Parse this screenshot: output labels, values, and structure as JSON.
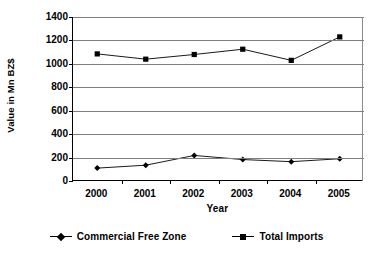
{
  "chart_data": {
    "type": "line",
    "title": "",
    "xlabel": "Year",
    "ylabel": "Value in Mn BZ$",
    "categories": [
      "2000",
      "2001",
      "2002",
      "2003",
      "2004",
      "2005"
    ],
    "ylim": [
      0,
      1400
    ],
    "yticks": [
      "1400",
      "1200",
      "1000",
      "800",
      "600",
      "400",
      "200",
      "0"
    ],
    "ytick_values": [
      1400,
      1200,
      1000,
      800,
      600,
      400,
      200,
      0
    ],
    "grid": true,
    "legend_position": "bottom",
    "series": [
      {
        "name": "Commercial Free Zone",
        "marker": "diamond",
        "color": "#000000",
        "values": [
          110,
          135,
          218,
          183,
          165,
          190
        ]
      },
      {
        "name": "Total Imports",
        "marker": "square",
        "color": "#000000",
        "values": [
          1085,
          1040,
          1080,
          1125,
          1030,
          1230
        ]
      }
    ]
  },
  "legend": {
    "items": [
      {
        "label": "Commercial Free Zone",
        "marker": "diamond"
      },
      {
        "label": "Total Imports",
        "marker": "square"
      }
    ]
  }
}
